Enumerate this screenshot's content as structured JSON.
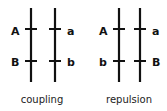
{
  "panels": [
    {
      "caption": "coupling",
      "left_chromosome": {
        "top_label": "A",
        "bottom_label": "B"
      },
      "right_chromosome": {
        "top_label": "a",
        "bottom_label": "b"
      }
    },
    {
      "caption": "repulsion",
      "left_chromosome": {
        "top_label": "A",
        "bottom_label": "b"
      },
      "right_chromosome": {
        "top_label": "a",
        "bottom_label": "B"
      }
    }
  ]
}
